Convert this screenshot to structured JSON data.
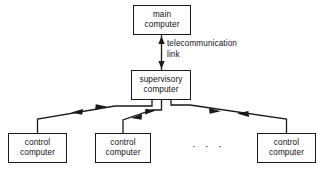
{
  "diagram": {
    "stroke_color": "#1a1a1a",
    "background_color": "#ffffff",
    "nodes": [
      {
        "id": "main-computer",
        "line1": "main",
        "line2": "computer",
        "x": 133,
        "y": 5,
        "w": 58,
        "h": 30
      },
      {
        "id": "supervisory-computer",
        "line1": "supervisory",
        "line2": "computer",
        "x": 131,
        "y": 70,
        "w": 60,
        "h": 30
      },
      {
        "id": "control-computer-1",
        "line1": "control",
        "line2": "computer",
        "x": 8,
        "y": 133,
        "w": 59,
        "h": 30
      },
      {
        "id": "control-computer-2",
        "line1": "control",
        "line2": "computer",
        "x": 95,
        "y": 133,
        "w": 56,
        "h": 30
      },
      {
        "id": "control-computer-n",
        "line1": "control",
        "line2": "computer",
        "x": 257,
        "y": 133,
        "w": 59,
        "h": 30
      }
    ],
    "edge_label": {
      "line1": "telecommunication",
      "line2": "link",
      "x": 167,
      "y": 39
    },
    "ellipsis": {
      "text": "· · ·",
      "x": 192,
      "y": 141
    }
  }
}
